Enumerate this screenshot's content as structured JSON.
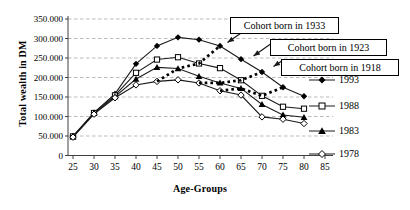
{
  "chart_data": {
    "type": "line",
    "title": "",
    "xlabel": "Age-Groups",
    "ylabel": "Total wealth in DM",
    "x_ticks": [
      "25",
      "30",
      "35",
      "40",
      "45",
      "50",
      "55",
      "60",
      "65",
      "70",
      "75",
      "80",
      "85"
    ],
    "y_ticks": [
      "0",
      "50.000",
      "100.000",
      "150.000",
      "200.000",
      "250.000",
      "300.000",
      "350.000"
    ],
    "y_tick_step": 50000,
    "ylim": [
      0,
      350000
    ],
    "grid": "horizontal-dashed",
    "legend_position": "right",
    "categories": [
      25,
      30,
      35,
      40,
      45,
      50,
      55,
      60,
      65,
      70,
      75,
      80
    ],
    "series": [
      {
        "name": "1993",
        "marker": "filled-diamond",
        "values": [
          50000,
          110000,
          158000,
          235000,
          281000,
          303000,
          297000,
          281000,
          247000,
          214000,
          175000,
          152000
        ]
      },
      {
        "name": "1988",
        "marker": "open-square",
        "values": [
          49000,
          109000,
          154000,
          212000,
          246000,
          252000,
          236000,
          224000,
          193000,
          153000,
          125000,
          120000
        ]
      },
      {
        "name": "1983",
        "marker": "filled-triangle",
        "values": [
          48000,
          108000,
          151000,
          196000,
          226000,
          223000,
          203000,
          186000,
          172000,
          131000,
          104000,
          98000
        ]
      },
      {
        "name": "1978",
        "marker": "open-diamond",
        "values": [
          47000,
          106000,
          148000,
          181000,
          190000,
          194000,
          186000,
          166000,
          155000,
          99000,
          93000,
          82000
        ]
      }
    ],
    "cohort_lines": [
      {
        "name": "Cohort born in 1933",
        "points": [
          [
            45,
            190000
          ],
          [
            50,
            223000
          ],
          [
            55,
            236000
          ],
          [
            60,
            281000
          ]
        ]
      },
      {
        "name": "Cohort born in 1923",
        "points": [
          [
            55,
            186000
          ],
          [
            60,
            186000
          ],
          [
            65,
            193000
          ],
          [
            70,
            214000
          ]
        ]
      },
      {
        "name": "Cohort born in 1918",
        "points": [
          [
            60,
            166000
          ],
          [
            65,
            172000
          ],
          [
            70,
            153000
          ],
          [
            75,
            175000
          ]
        ]
      }
    ]
  },
  "annotations": {
    "boxes": [
      {
        "label": "Cohort born in 1933"
      },
      {
        "label": "Cohort born in 1923"
      },
      {
        "label": "Cohort born in 1918"
      }
    ]
  },
  "colors": {
    "line": "#1a1a1a",
    "grid": "#b3b3b3",
    "axis": "#404040",
    "marker_fill": "#000000",
    "marker_open": "#ffffff"
  }
}
